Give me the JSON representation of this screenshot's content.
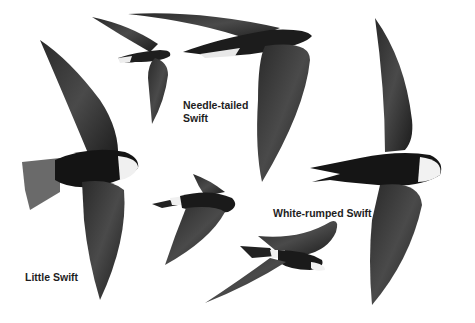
{
  "plate": {
    "background": "#ffffff",
    "bird_color_dark": "#1a1a1a",
    "bird_color_mid": "#555555",
    "patch_color": "#f2f2f2"
  },
  "labels": {
    "needle_tailed": {
      "line1": "Needle-tailed",
      "line2": "Swift"
    },
    "white_rumped": "White-rumped Swift",
    "little": "Little Swift"
  },
  "birds": [
    {
      "species": "Needle-tailed Swift",
      "pose": "small-top-left"
    },
    {
      "species": "Needle-tailed Swift",
      "pose": "large-top-right"
    },
    {
      "species": "Little Swift",
      "pose": "large-left"
    },
    {
      "species": "Little Swift",
      "pose": "small-center"
    },
    {
      "species": "White-rumped Swift",
      "pose": "large-right"
    },
    {
      "species": "White-rumped Swift",
      "pose": "small-bottom-center"
    }
  ]
}
